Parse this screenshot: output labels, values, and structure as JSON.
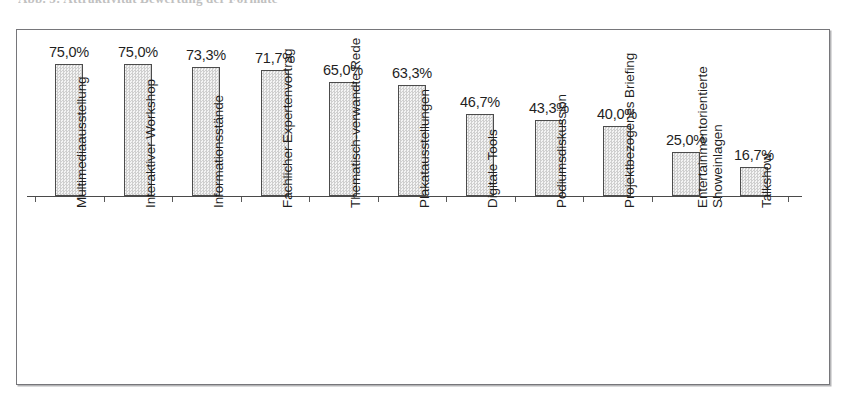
{
  "caption": {
    "text": "Abb. 5: Attraktivität Bewertung der Formate"
  },
  "figure": {
    "name": "bar-chart-figure"
  },
  "chart_data": {
    "type": "bar",
    "title": "",
    "xlabel": "",
    "ylabel": "",
    "ylim": [
      0,
      80
    ],
    "grid": false,
    "legend": "none",
    "value_label_format": "percent-comma-one-decimal",
    "categories": [
      "Multimediaausstellung",
      "Interaktiver Workshop",
      "Informationsstände",
      "Fachlicher Expertenvortrag",
      "Thematisch-verwandte Rede",
      "Plakatausstellungen",
      "Digitale Tools",
      "Podiumsdiskussion",
      "Projektbezogenes Briefing",
      "Entertainmentorientierte Showeinlagen",
      "Talkshow"
    ],
    "category_lines": [
      [
        "Multimediaausstellung"
      ],
      [
        "Interaktiver Workshop"
      ],
      [
        "Informationsstände"
      ],
      [
        "Fachlicher Expertenvortrag"
      ],
      [
        "Thematisch-verwandte Rede"
      ],
      [
        "Plakatausstellungen"
      ],
      [
        "Digitale Tools"
      ],
      [
        "Podiumsdiskussion"
      ],
      [
        "Projektbezogenes Briefing"
      ],
      [
        "Entertainmentorientierte",
        "Showeinlagen"
      ],
      [
        "Talkshow"
      ]
    ],
    "values": [
      75.0,
      75.0,
      73.3,
      71.7,
      65.0,
      63.3,
      46.7,
      43.3,
      40.0,
      25.0,
      16.7
    ],
    "value_labels": [
      "75,0%",
      "75,0%",
      "73,3%",
      "71,7%",
      "65,0%",
      "63,3%",
      "46,7%",
      "43,3%",
      "40,0%",
      "25,0%",
      "16,7%"
    ]
  },
  "colors": {
    "bar_fill": "#e2e2e2",
    "bar_border": "#4c4c4c",
    "frame_border": "#76767a",
    "text": "#1f1f1f",
    "background": "#ffffff"
  }
}
